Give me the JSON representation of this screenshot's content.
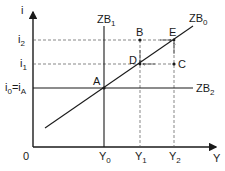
{
  "axes": {
    "y_label": "i",
    "x_label": "Y",
    "origin_label": "0"
  },
  "y_ticks": [
    {
      "main": "i",
      "sub": "2"
    },
    {
      "main": "i",
      "sub": "1"
    },
    {
      "main": "i",
      "sub": "0",
      "suffix": "=i",
      "suffix_sub": "A"
    }
  ],
  "x_ticks": [
    {
      "main": "Y",
      "sub": "0"
    },
    {
      "main": "Y",
      "sub": "1"
    },
    {
      "main": "Y",
      "sub": "2"
    }
  ],
  "curves": {
    "zb0": {
      "main": "ZB",
      "sub": "0"
    },
    "zb1": {
      "main": "ZB",
      "sub": "1"
    },
    "zb2": {
      "main": "ZB",
      "sub": "2"
    }
  },
  "points": {
    "A": "A",
    "B": "B",
    "C": "C",
    "D": "D",
    "E": "E"
  },
  "colors": {
    "line": "#1a1a1a",
    "dashed": "#555555"
  }
}
